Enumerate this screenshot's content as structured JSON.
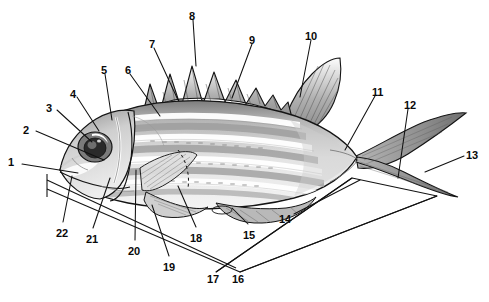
{
  "figure": {
    "style": "grayscale-stipple-line-illustration",
    "background_color": "#ffffff",
    "ink_color": "#111111",
    "width": 489,
    "height": 302
  },
  "callouts": [
    {
      "id": "1",
      "label": "1",
      "x": 8,
      "y": 157,
      "leader": [
        [
          22,
          164
        ],
        [
          78,
          173
        ]
      ]
    },
    {
      "id": "2",
      "label": "2",
      "x": 23,
      "y": 125,
      "leader": [
        [
          36,
          131
        ],
        [
          104,
          160
        ]
      ]
    },
    {
      "id": "3",
      "label": "3",
      "x": 46,
      "y": 103,
      "leader": [
        [
          57,
          110
        ],
        [
          92,
          142
        ]
      ]
    },
    {
      "id": "4",
      "label": "4",
      "x": 70,
      "y": 89,
      "leader": [
        [
          77,
          97
        ],
        [
          99,
          131
        ]
      ]
    },
    {
      "id": "5",
      "label": "5",
      "x": 101,
      "y": 65,
      "leader": [
        [
          105,
          74
        ],
        [
          112,
          120
        ]
      ]
    },
    {
      "id": "6",
      "label": "6",
      "x": 125,
      "y": 65,
      "leader": [
        [
          130,
          74
        ],
        [
          160,
          116
        ]
      ]
    },
    {
      "id": "7",
      "label": "7",
      "x": 149,
      "y": 39,
      "leader": [
        [
          154,
          48
        ],
        [
          178,
          100
        ]
      ]
    },
    {
      "id": "8",
      "label": "8",
      "x": 189,
      "y": 11,
      "leader": [
        [
          193,
          20
        ],
        [
          196,
          66
        ]
      ]
    },
    {
      "id": "9",
      "label": "9",
      "x": 249,
      "y": 35,
      "leader": [
        [
          252,
          44
        ],
        [
          232,
          98
        ]
      ]
    },
    {
      "id": "10",
      "label": "10",
      "x": 305,
      "y": 31,
      "leader": [
        [
          311,
          40
        ],
        [
          300,
          97
        ]
      ]
    },
    {
      "id": "11",
      "label": "11",
      "x": 372,
      "y": 87,
      "leader": [
        [
          375,
          96
        ],
        [
          345,
          150
        ]
      ]
    },
    {
      "id": "12",
      "label": "12",
      "x": 404,
      "y": 100,
      "leader": [
        [
          408,
          109
        ],
        [
          398,
          178
        ]
      ]
    },
    {
      "id": "13",
      "label": "13",
      "x": 466,
      "y": 150,
      "leader": [
        [
          464,
          156
        ],
        [
          425,
          172
        ]
      ]
    },
    {
      "id": "14",
      "label": "14",
      "x": 279,
      "y": 214,
      "leader": [
        [
          294,
          214
        ],
        [
          360,
          180
        ]
      ]
    },
    {
      "id": "15",
      "label": "15",
      "x": 243,
      "y": 230,
      "leader": [
        [
          248,
          224
        ],
        [
          232,
          208
        ]
      ]
    },
    {
      "id": "16",
      "label": "16",
      "x": 232,
      "y": 274,
      "leader": [
        [
          240,
          272
        ],
        [
          437,
          196
        ]
      ]
    },
    {
      "id": "17",
      "label": "17",
      "x": 207,
      "y": 274,
      "leader": [
        [
          216,
          272
        ],
        [
          352,
          178
        ]
      ]
    },
    {
      "id": "18",
      "label": "18",
      "x": 190,
      "y": 233,
      "leader": [
        [
          196,
          227
        ],
        [
          178,
          186
        ]
      ]
    },
    {
      "id": "19",
      "label": "19",
      "x": 163,
      "y": 262,
      "leader": [
        [
          169,
          256
        ],
        [
          152,
          205
        ]
      ]
    },
    {
      "id": "20",
      "label": "20",
      "x": 128,
      "y": 246,
      "leader": [
        [
          135,
          240
        ],
        [
          136,
          170
        ]
      ]
    },
    {
      "id": "21",
      "label": "21",
      "x": 86,
      "y": 234,
      "leader": [
        [
          93,
          228
        ],
        [
          110,
          178
        ]
      ]
    },
    {
      "id": "22",
      "label": "22",
      "x": 56,
      "y": 228,
      "leader": [
        [
          63,
          222
        ],
        [
          72,
          176
        ]
      ]
    }
  ],
  "anatomy_notes": {
    "dorsal_spiny_fin": "serrated triangular spines along upper back",
    "caudal_fin": "deeply forked tail",
    "eye": "large eye with white crescent highlight",
    "body_pattern": "horizontal light-and-dark longitudinal stripes",
    "fins_shown": [
      "spiny dorsal",
      "soft dorsal",
      "pectoral",
      "pelvic",
      "anal",
      "caudal"
    ],
    "baseline_rule": "standard-length measurement rule beneath the fish"
  },
  "palette": {
    "paper": "#ffffff",
    "line": "#141414",
    "body_light": "#e8e8e8",
    "body_mid": "#bcbcbc",
    "body_dark": "#8e8e8e",
    "fin_tone": "#a8a8a8",
    "stripe": "#9a9a9a"
  }
}
